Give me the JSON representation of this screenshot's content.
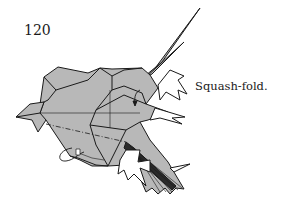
{
  "diagram": {
    "step_number": "120",
    "instruction": "Squash-fold.",
    "paper_color": "#b8b8b8",
    "line_color": "#1a1a1a",
    "background": "#ffffff"
  }
}
